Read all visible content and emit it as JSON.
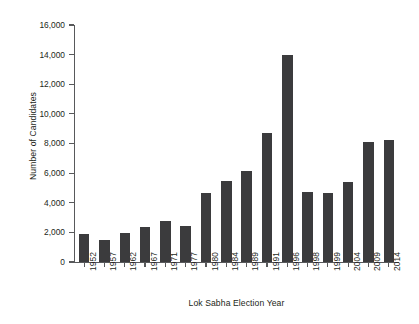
{
  "chart_data": {
    "type": "bar",
    "title": "",
    "xlabel": "Lok Sabha Election Year",
    "ylabel": "Number of Candidates",
    "categories": [
      "1952",
      "1957",
      "1962",
      "1967",
      "1971",
      "1977",
      "1980",
      "1984",
      "1989",
      "1991",
      "1996",
      "1998",
      "1999",
      "2004",
      "2009",
      "2014"
    ],
    "values": [
      1874,
      1519,
      1985,
      2369,
      2784,
      2439,
      4629,
      5492,
      6160,
      8699,
      13952,
      4750,
      4648,
      5435,
      8070,
      8251
    ],
    "ylim": [
      0,
      16000
    ],
    "ytick_values": [
      0,
      2000,
      4000,
      6000,
      8000,
      10000,
      12000,
      14000,
      16000
    ],
    "ytick_labels": [
      "0",
      "2,000",
      "4,000",
      "6,000",
      "8,000",
      "10,000",
      "12,000",
      "14,000",
      "16,000"
    ],
    "grid": false,
    "legend": false,
    "bar_color": "#3b3b3d",
    "axis_color": "#58595b",
    "text_color": "#231f20",
    "background": "#ffffff"
  }
}
